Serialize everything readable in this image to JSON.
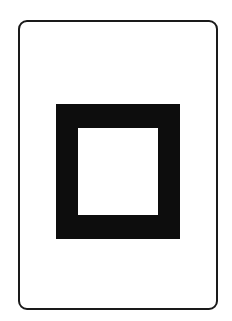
{
  "diagram": {
    "type": "symbol-card",
    "colors": {
      "background": "#ffffff",
      "card_border": "#1a1a1a",
      "square_fill": "#0d0d0d",
      "square_hole": "#ffffff"
    },
    "shapes": [
      {
        "name": "card",
        "shape": "rounded-rectangle",
        "x": 18,
        "y": 20,
        "width": 200,
        "height": 290,
        "stroke": "#1a1a1a"
      },
      {
        "name": "hollow-square-outer",
        "shape": "rectangle",
        "x": 56,
        "y": 104,
        "width": 124,
        "height": 135,
        "fill": "#0d0d0d"
      },
      {
        "name": "hollow-square-inner",
        "shape": "rectangle",
        "x": 78,
        "y": 128,
        "width": 80,
        "height": 87,
        "fill": "#ffffff"
      }
    ]
  }
}
